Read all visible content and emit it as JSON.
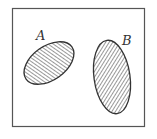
{
  "diagram": {
    "type": "venn",
    "universe": {
      "x": 12,
      "y": 8,
      "width": 132,
      "height": 118,
      "stroke": "#555555"
    },
    "sets": [
      {
        "label": "A",
        "cx": 49,
        "cy": 63,
        "rx": 28,
        "ry": 17,
        "rotation": -35,
        "label_x": 37,
        "label_y": 40,
        "fill": "hatched"
      },
      {
        "label": "B",
        "cx": 112,
        "cy": 77,
        "rx": 18,
        "ry": 37,
        "rotation": -8,
        "label_x": 122,
        "label_y": 45,
        "fill": "hatched"
      }
    ],
    "hatch_color": "#444444",
    "outline_color": "#333333"
  }
}
